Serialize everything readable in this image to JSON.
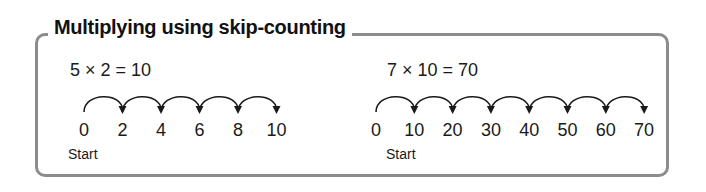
{
  "title": "Multiplying using skip-counting",
  "examples": [
    {
      "equation": "5 × 2 = 10",
      "start_label": "Start",
      "numbers": [
        "0",
        "2",
        "4",
        "6",
        "8",
        "10"
      ]
    },
    {
      "equation": "7 × 10 = 70",
      "start_label": "Start",
      "numbers": [
        "0",
        "10",
        "20",
        "30",
        "40",
        "50",
        "60",
        "70"
      ]
    }
  ],
  "colors": {
    "frame": "#8c8c8c",
    "text": "#1a1a1a"
  }
}
